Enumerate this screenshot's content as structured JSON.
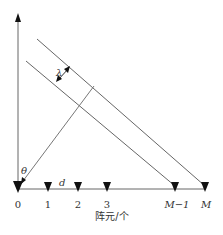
{
  "diagram": {
    "type": "uniform-linear-array-geometry",
    "symbols": {
      "wavelength": "λ",
      "angle": "θ",
      "spacing": "d"
    },
    "elements": [
      {
        "label": "0",
        "x": 18
      },
      {
        "label": "1",
        "x": 48
      },
      {
        "label": "2",
        "x": 78
      },
      {
        "label": "3",
        "x": 107
      },
      {
        "label": "M−1",
        "x": 175
      },
      {
        "label": "M",
        "x": 205
      }
    ],
    "axis_label": "阵元/个",
    "colors": {
      "line": "#555555",
      "marker": "#111111",
      "text": "#333333"
    }
  }
}
